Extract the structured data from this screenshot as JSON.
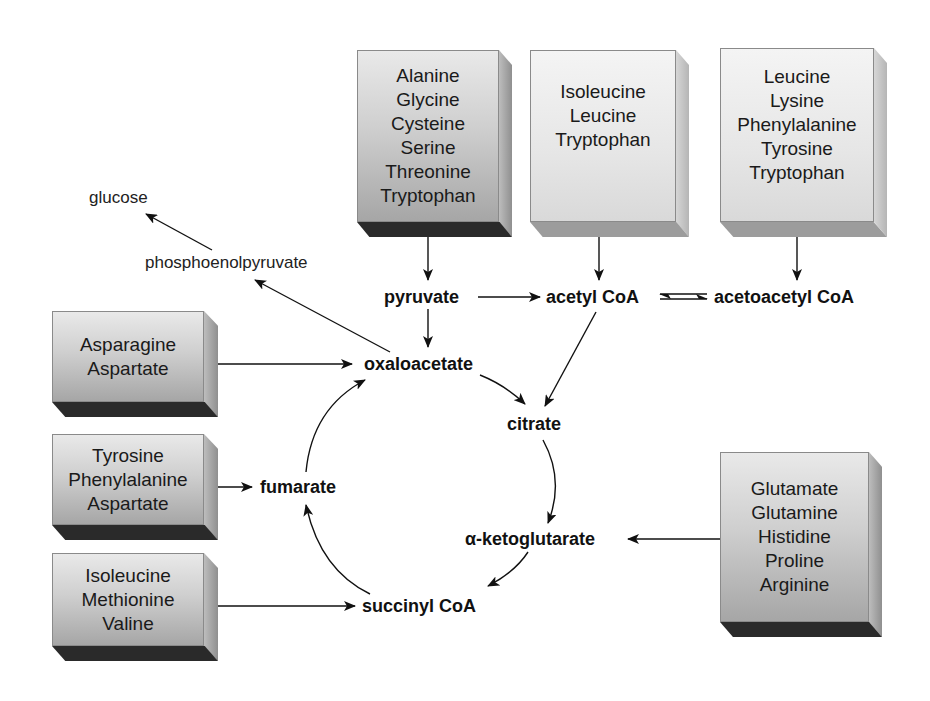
{
  "diagram": {
    "source_boxes": [
      {
        "id": "box-pyruvate-precursors",
        "shade": "dark",
        "items": [
          "Alanine",
          "Glycine",
          "Cysteine",
          "Serine",
          "Threonine",
          "Tryptophan"
        ],
        "target": "pyruvate"
      },
      {
        "id": "box-acetylcoa-precursors",
        "shade": "light",
        "items": [
          "Isoleucine",
          "Leucine",
          "Tryptophan"
        ],
        "target": "acetyl CoA"
      },
      {
        "id": "box-acetoacetylcoa-precursors",
        "shade": "light",
        "items": [
          "Leucine",
          "Lysine",
          "Phenylalanine",
          "Tyrosine",
          "Tryptophan"
        ],
        "target": "acetoacetyl CoA"
      },
      {
        "id": "box-oxaloacetate-precursors",
        "shade": "dark",
        "items": [
          "Asparagine",
          "Aspartate"
        ],
        "target": "oxaloacetate"
      },
      {
        "id": "box-fumarate-precursors",
        "shade": "dark",
        "items": [
          "Tyrosine",
          "Phenylalanine",
          "Aspartate"
        ],
        "target": "fumarate"
      },
      {
        "id": "box-succinylcoa-precursors",
        "shade": "dark",
        "items": [
          "Isoleucine",
          "Methionine",
          "Valine"
        ],
        "target": "succinyl CoA"
      },
      {
        "id": "box-ketoglutarate-precursors",
        "shade": "dark",
        "items": [
          "Glutamate",
          "Glutamine",
          "Histidine",
          "Proline",
          "Arginine"
        ],
        "target": "α-ketoglutarate"
      }
    ],
    "metabolites": {
      "glucose": "glucose",
      "phosphoenolpyruvate": "phosphoenolpyruvate",
      "pyruvate": "pyruvate",
      "acetyl_coa": "acetyl CoA",
      "acetoacetyl_coa": "acetoacetyl CoA",
      "oxaloacetate": "oxaloacetate",
      "citrate": "citrate",
      "alpha_ketoglutarate": "α-ketoglutarate",
      "succinyl_coa": "succinyl CoA",
      "fumarate": "fumarate"
    },
    "edges": [
      {
        "from": "phosphoenolpyruvate",
        "to": "glucose"
      },
      {
        "from": "oxaloacetate",
        "to": "phosphoenolpyruvate"
      },
      {
        "from": "pyruvate",
        "to": "acetyl CoA"
      },
      {
        "from": "pyruvate",
        "to": "oxaloacetate"
      },
      {
        "from": "acetyl CoA",
        "to": "acetoacetyl CoA",
        "reversible": true
      },
      {
        "from": "acetyl CoA",
        "to": "citrate"
      },
      {
        "from": "oxaloacetate",
        "to": "citrate"
      },
      {
        "from": "citrate",
        "to": "α-ketoglutarate"
      },
      {
        "from": "α-ketoglutarate",
        "to": "succinyl CoA"
      },
      {
        "from": "succinyl CoA",
        "to": "fumarate"
      },
      {
        "from": "fumarate",
        "to": "oxaloacetate"
      }
    ]
  }
}
